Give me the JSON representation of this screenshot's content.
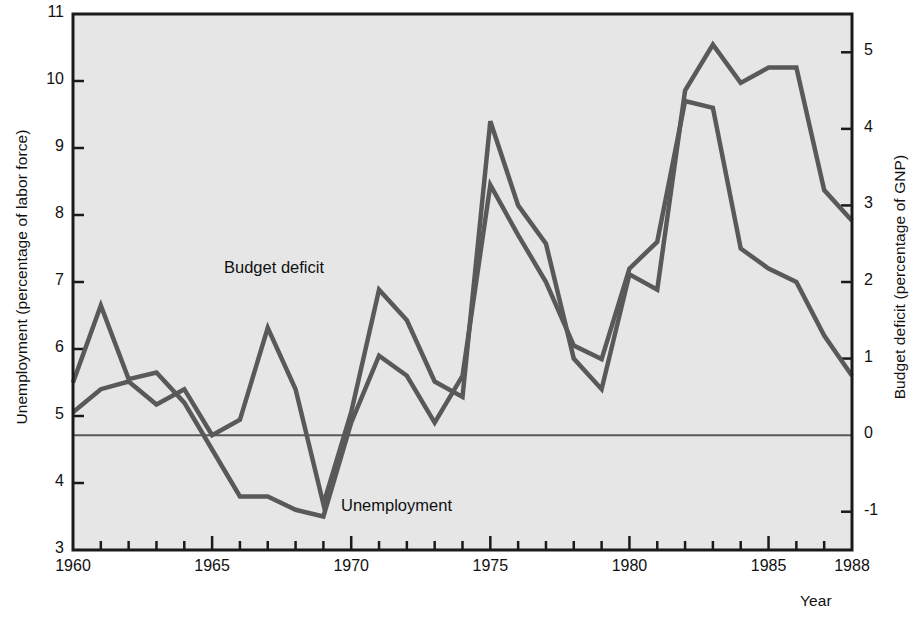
{
  "figure": {
    "background_color": "#ffffff",
    "plot_background_color": "#e6e6e6",
    "frame_color": "#1a1a1a",
    "line_color": "#58595b",
    "zero_line_color": "#58595b"
  },
  "left_axis": {
    "title": "Unemployment (percentage of labor force)",
    "ticks": [
      "11",
      "10",
      "9",
      "8",
      "7",
      "6",
      "5",
      "4",
      "3"
    ],
    "min": 3,
    "max": 11
  },
  "right_axis": {
    "title": "Budget deficit (percentage of GNP)",
    "ticks": [
      "5",
      "4",
      "3",
      "2",
      "1",
      "0",
      "-1"
    ],
    "min": -1.5,
    "max": 5.5
  },
  "x_axis": {
    "title": "Year",
    "ticks": [
      "1960",
      "1965",
      "1970",
      "1975",
      "1980",
      "1985",
      "1988"
    ],
    "min": 1960,
    "max": 1988,
    "minor_tick_step": 1
  },
  "series_labels": {
    "budget_deficit": "Budget deficit",
    "unemployment": "Unemployment"
  },
  "chart_data": {
    "type": "line",
    "title": "",
    "xlabel": "Year",
    "ylabel": "Unemployment (percentage of labor force)",
    "y2label": "Budget deficit (percentage of GNP)",
    "xlim": [
      1960,
      1988
    ],
    "ylim": [
      3,
      11
    ],
    "y2lim": [
      -1.5,
      5.5
    ],
    "grid": false,
    "legend": "inline-annotations",
    "x": [
      1960,
      1961,
      1962,
      1963,
      1964,
      1965,
      1966,
      1967,
      1968,
      1969,
      1970,
      1971,
      1972,
      1973,
      1974,
      1975,
      1976,
      1977,
      1978,
      1979,
      1980,
      1981,
      1982,
      1983,
      1984,
      1985,
      1986,
      1987,
      1988
    ],
    "series": [
      {
        "name": "Unemployment",
        "axis": "left",
        "unit": "percentage of labor force",
        "values": [
          5.5,
          6.65,
          5.55,
          5.65,
          5.2,
          4.5,
          3.8,
          3.8,
          3.6,
          3.5,
          4.9,
          5.9,
          5.6,
          4.9,
          5.6,
          8.45,
          7.7,
          7.0,
          6.05,
          5.85,
          7.2,
          7.6,
          9.7,
          9.6,
          7.5,
          7.2,
          7.0,
          6.2,
          5.6
        ]
      },
      {
        "name": "Budget deficit",
        "axis": "right",
        "unit": "percentage of GNP",
        "values": [
          0.3,
          0.6,
          0.7,
          0.4,
          0.6,
          0.0,
          0.2,
          1.4,
          0.6,
          -0.9,
          0.3,
          1.9,
          1.5,
          0.7,
          0.5,
          4.1,
          3.0,
          2.5,
          1.0,
          0.6,
          2.1,
          1.9,
          4.5,
          5.1,
          4.6,
          4.8,
          4.8,
          3.2,
          2.8
        ]
      }
    ]
  }
}
